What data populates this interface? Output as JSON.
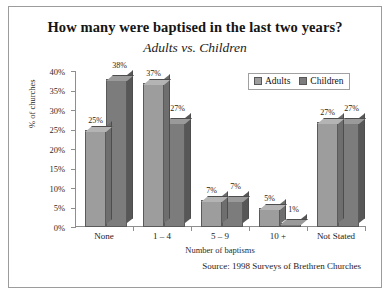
{
  "chart_data": {
    "type": "bar",
    "title": "How many were baptised in the last two years?",
    "subtitle": "Adults vs. Children",
    "xlabel": "Number of baptisms",
    "ylabel": "% of churches",
    "ylim": [
      0,
      40
    ],
    "yticks": [
      "0%",
      "5%",
      "10%",
      "15%",
      "20%",
      "25%",
      "30%",
      "35%",
      "40%"
    ],
    "ytick_values": [
      0,
      5,
      10,
      15,
      20,
      25,
      30,
      35,
      40
    ],
    "grid": false,
    "legend_position": "top-right",
    "categories": [
      "None",
      "1 – 4",
      "5 – 9",
      "10 +",
      "Not Stated"
    ],
    "series": [
      {
        "name": "Adults",
        "color": "#9d9d9d",
        "values": [
          25,
          37,
          7,
          5,
          27
        ],
        "labels": [
          "25%",
          "37%",
          "7%",
          "5%",
          "27%"
        ]
      },
      {
        "name": "Children",
        "color": "#7c7c7c",
        "values": [
          38,
          27,
          7,
          1,
          27
        ],
        "labels": [
          "38%",
          "27%",
          "7%",
          "1%",
          "27%"
        ]
      }
    ],
    "source": "Source: 1998 Surveys of Brethren Churches"
  },
  "legend": {
    "items": [
      {
        "label": "Adults",
        "marker": "square-marker"
      },
      {
        "label": "Children",
        "marker": "square-marker"
      }
    ]
  }
}
